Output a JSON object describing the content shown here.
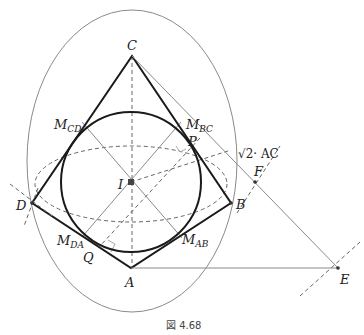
{
  "figure": {
    "caption": "図 4.68",
    "colors": {
      "bold": "#1a1a1a",
      "thin": "#8a8a8a",
      "dashed": "#666666"
    }
  },
  "points": {
    "C": {
      "label": "C",
      "x": 132,
      "y": 56
    },
    "A": {
      "label": "A",
      "x": 131,
      "y": 268
    },
    "D": {
      "label": "D",
      "x": 32,
      "y": 203
    },
    "B": {
      "label": "B",
      "x": 231,
      "y": 203
    },
    "I": {
      "label": "I",
      "x": 131,
      "y": 182
    },
    "E": {
      "label": "E",
      "x": 338,
      "y": 268
    },
    "F": {
      "label": "F",
      "x": 255,
      "y": 182
    },
    "P": {
      "label": "P",
      "x": 193,
      "y": 146
    },
    "Q": {
      "label": "Q",
      "x": 100,
      "y": 246
    }
  },
  "midpoints": {
    "MCD": {
      "main": "M",
      "sub": "CD"
    },
    "MBC": {
      "main": "M",
      "sub": "BC"
    },
    "MDA": {
      "main": "M",
      "sub": "DA"
    },
    "MAB": {
      "main": "M",
      "sub": "AB"
    }
  },
  "annotations": {
    "sqrt_label": "√2· AC"
  }
}
